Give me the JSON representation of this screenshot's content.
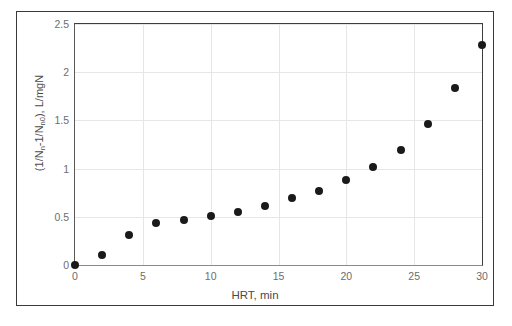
{
  "figure": {
    "background_color": "#ffffff",
    "frame_color": "#3a3a3a",
    "marker_color": "#1a1a1a",
    "gridline_color": "#e6e6e6",
    "axis_color": "#595959",
    "tick_label_color": "#6d6d6d"
  },
  "chart_data": {
    "type": "scatter",
    "title": "",
    "xlabel": "HRT, min",
    "ylabel": "(1/Nn-1/Nn0), L/mgN",
    "ylabel_parts": {
      "prefix": "(1/N",
      "sub1": "n",
      "middle": "-1/N",
      "sub2": "n0",
      "suffix": "), L/mgN"
    },
    "xlim": [
      0,
      30
    ],
    "ylim": [
      0,
      2.5
    ],
    "xticks": [
      0,
      5,
      10,
      15,
      20,
      25,
      30
    ],
    "xtick_labels": [
      "0",
      "5",
      "10",
      "15",
      "20",
      "25",
      "30"
    ],
    "yticks": [
      0,
      0.5,
      1,
      1.5,
      2,
      2.5
    ],
    "ytick_labels": [
      "0",
      "0.5",
      "1",
      "1.5",
      "2",
      "2.5"
    ],
    "grid": true,
    "grid_axes": "both",
    "legend": false,
    "legend_position": "none",
    "marker": "filled-circle",
    "x": [
      0,
      2,
      4,
      6,
      8,
      10,
      12,
      14,
      16,
      18,
      20,
      22,
      24,
      26,
      28,
      30
    ],
    "values": [
      0.0,
      0.1,
      0.31,
      0.44,
      0.47,
      0.51,
      0.55,
      0.61,
      0.7,
      0.77,
      0.88,
      1.02,
      1.19,
      1.46,
      1.84,
      2.28
    ],
    "series": [
      {
        "name": "",
        "points": [
          {
            "x": 0,
            "y": 0.0
          },
          {
            "x": 2,
            "y": 0.1
          },
          {
            "x": 4,
            "y": 0.31
          },
          {
            "x": 6,
            "y": 0.44
          },
          {
            "x": 8,
            "y": 0.47
          },
          {
            "x": 10,
            "y": 0.51
          },
          {
            "x": 12,
            "y": 0.55
          },
          {
            "x": 14,
            "y": 0.61
          },
          {
            "x": 16,
            "y": 0.7
          },
          {
            "x": 18,
            "y": 0.77
          },
          {
            "x": 20,
            "y": 0.88
          },
          {
            "x": 22,
            "y": 1.02
          },
          {
            "x": 24,
            "y": 1.19
          },
          {
            "x": 26,
            "y": 1.46
          },
          {
            "x": 28,
            "y": 1.84
          },
          {
            "x": 30,
            "y": 2.28
          }
        ]
      }
    ]
  }
}
